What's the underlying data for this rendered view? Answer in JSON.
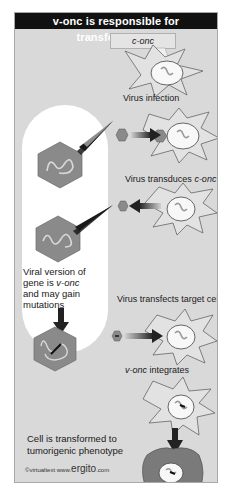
{
  "title": "v-onc is responsible for transformation",
  "callout": "c-onc",
  "steps": [
    {
      "label": "Virus infection"
    },
    {
      "label": "Virus transduces ",
      "italic": "c-onc"
    },
    {
      "label": "Virus transfects target cell"
    },
    {
      "italic": "v-onc",
      "label": " integrates"
    }
  ],
  "side_text": {
    "line1": "Viral version of",
    "line2_pre": "gene is ",
    "line2_italic": "v-onc",
    "line3": "and may gain",
    "line4": "mutations"
  },
  "result": {
    "line1": "Cell is transformed to",
    "line2": "tumorigenic phenotype"
  },
  "credit": {
    "prefix": "©virtualtext  www.",
    "brand": "ergito",
    "suffix": ".com"
  },
  "colors": {
    "background": "#d9d9d9",
    "header": "#111111",
    "hexagon": "#8a8a8a",
    "transformed_cell": "#7a7a7a",
    "arrow": "#222222"
  }
}
